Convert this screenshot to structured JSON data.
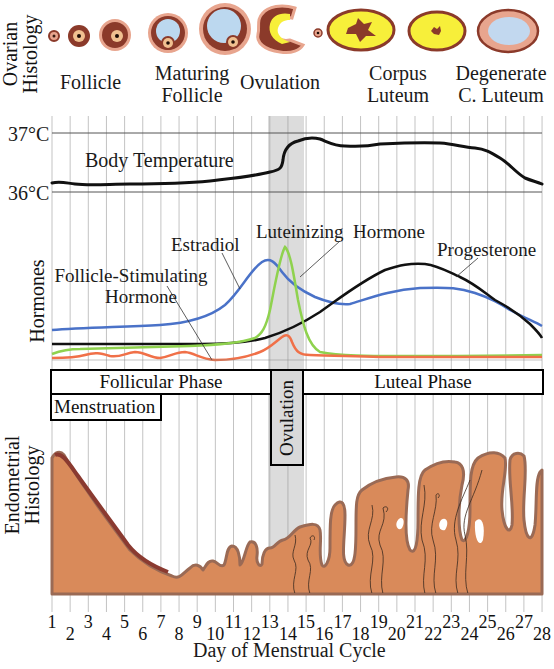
{
  "panels": {
    "ovarian": {
      "axis_label_line1": "Ovarian",
      "axis_label_line2": "Histology",
      "stages": [
        {
          "label_line1": "Follicle",
          "label_line2": ""
        },
        {
          "label_line1": "Maturing",
          "label_line2": "Follicle"
        },
        {
          "label_line1": "Ovulation",
          "label_line2": ""
        },
        {
          "label_line1": "Corpus",
          "label_line2": "Luteum"
        },
        {
          "label_line1": "Degenerate",
          "label_line2": "C. Luteum"
        }
      ]
    },
    "temperature": {
      "tick_high": "37°C",
      "tick_low": "36°C",
      "series_label": "Body Temperature"
    },
    "hormones": {
      "axis_label": "Hormones",
      "labels": {
        "estradiol": "Estradiol",
        "fsh_line1": "Follicle-Stimulating",
        "fsh_line2": "Hormone",
        "lh": "Luteinizing  Hormone",
        "progesterone": "Progesterone"
      }
    },
    "phases": {
      "follicular": "Follicular Phase",
      "ovulation": "Ovulation",
      "luteal": "Luteal Phase",
      "menstruation": "Menstruation"
    },
    "endometrium": {
      "axis_label_line1": "Endometrial",
      "axis_label_line2": "Histology"
    },
    "x_axis": {
      "title": "Day of Menstrual Cycle",
      "ticks": [
        "1",
        "2",
        "3",
        "4",
        "5",
        "6",
        "7",
        "8",
        "9",
        "10",
        "11",
        "12",
        "13",
        "14",
        "15",
        "16",
        "17",
        "18",
        "19",
        "20",
        "21",
        "22",
        "23",
        "24",
        "25",
        "26",
        "27",
        "28"
      ]
    }
  },
  "colors": {
    "estradiol": "#4a72c8",
    "lh": "#8fd24e",
    "fsh": "#f07048",
    "progesterone": "#111111",
    "temperature": "#111111",
    "ovulation_band": "#d9d9d9",
    "endometrium_fill": "#d98a5a",
    "endometrium_edge": "#9a5a48",
    "follicle_dark": "#8b3a2a",
    "follicle_pink": "#e8a58e",
    "antrum_blue": "#bcd8ef",
    "luteum_yellow": "#f7ef3a"
  },
  "chart_data": {
    "type": "line",
    "title": "",
    "xlabel": "Day of Menstrual Cycle",
    "x": [
      1,
      2,
      3,
      4,
      5,
      6,
      7,
      8,
      9,
      10,
      11,
      12,
      13,
      14,
      15,
      16,
      17,
      18,
      19,
      20,
      21,
      22,
      23,
      24,
      25,
      26,
      27,
      28
    ],
    "series": [
      {
        "name": "Body Temperature (°C)",
        "values": [
          36.15,
          36.13,
          36.1,
          36.1,
          36.12,
          36.12,
          36.12,
          36.12,
          36.14,
          36.17,
          36.2,
          36.24,
          36.28,
          36.85,
          36.93,
          36.78,
          36.79,
          36.81,
          36.83,
          36.83,
          36.84,
          36.81,
          36.75,
          36.72,
          36.6,
          36.45,
          36.25,
          36.15
        ]
      },
      {
        "name": "Estradiol (relative)",
        "values": [
          0.25,
          0.26,
          0.27,
          0.27,
          0.28,
          0.28,
          0.29,
          0.31,
          0.35,
          0.42,
          0.55,
          0.8,
          0.92,
          0.7,
          0.52,
          0.44,
          0.48,
          0.56,
          0.6,
          0.62,
          0.63,
          0.63,
          0.62,
          0.58,
          0.5,
          0.4,
          0.3,
          0.2
        ]
      },
      {
        "name": "Luteinizing Hormone (relative)",
        "values": [
          0.03,
          0.07,
          0.08,
          0.09,
          0.09,
          0.1,
          0.11,
          0.12,
          0.13,
          0.15,
          0.18,
          0.23,
          0.95,
          0.5,
          0.06,
          0.02,
          0.02,
          0.02,
          0.02,
          0.02,
          0.02,
          0.02,
          0.02,
          0.02,
          0.03,
          0.03,
          0.03,
          0.03
        ]
      },
      {
        "name": "Follicle-Stimulating Hormone (relative)",
        "values": [
          0.03,
          0.03,
          0.07,
          0.04,
          0.07,
          0.03,
          0.07,
          0.02,
          0.02,
          0.02,
          0.05,
          0.06,
          0.07,
          0.3,
          0.05,
          0.05,
          0.04,
          0.04,
          0.03,
          0.03,
          0.03,
          0.03,
          0.03,
          0.03,
          0.03,
          0.03,
          0.03,
          0.03
        ]
      },
      {
        "name": "Progesterone (relative)",
        "values": [
          0.12,
          0.12,
          0.12,
          0.12,
          0.12,
          0.12,
          0.12,
          0.12,
          0.12,
          0.12,
          0.13,
          0.15,
          0.2,
          0.26,
          0.35,
          0.47,
          0.6,
          0.72,
          0.82,
          0.88,
          0.89,
          0.85,
          0.75,
          0.64,
          0.52,
          0.4,
          0.28,
          0.15
        ]
      }
    ],
    "annotations": [
      "Follicular Phase (days 1-12)",
      "Ovulation (day ~13-14)",
      "Luteal Phase (days 15-28)",
      "Menstruation (days 1-6)"
    ],
    "grid": true
  }
}
